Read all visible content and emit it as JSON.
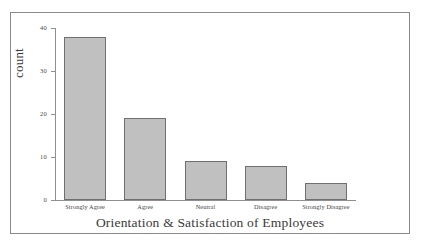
{
  "chart_data": {
    "type": "bar",
    "title": "",
    "xlabel": "Orientation & Satisfaction of Employees",
    "ylabel": "count",
    "categories": [
      "Strongly Agree",
      "Agree",
      "Neutral",
      "Disagree",
      "Strongly Disagree"
    ],
    "values": [
      38,
      19,
      9,
      8,
      4
    ],
    "ylim": [
      0,
      40
    ],
    "yticks": [
      0,
      10,
      20,
      30,
      40
    ],
    "ytick_labels": [
      "0",
      "10",
      "20",
      "30",
      "40"
    ],
    "grid": false,
    "legend": null,
    "orientation": "vertical",
    "bar_color": "#c0c0c0",
    "bar_edge_color": "#6f6f6f",
    "axis_color": "#8f8f8f",
    "frame_color": "#8a8a8a",
    "background": "#ffffff"
  }
}
